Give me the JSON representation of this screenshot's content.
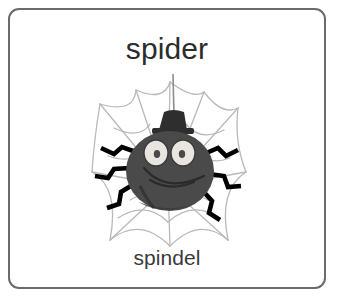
{
  "card": {
    "headword": "spider",
    "translation": "spindel",
    "border_color": "#6b6b6b",
    "background_color": "#ffffff",
    "text_color": "#2c2c2c"
  },
  "illustration": {
    "alt_label": "cartoon spider wearing a top hat hanging on a web",
    "subject": "spider",
    "accessory": "top-hat",
    "background": "spider-web",
    "colors": {
      "body": "#4a4a4a",
      "body_shadow": "#3a3a3a",
      "hat": "#2e2e2e",
      "legs": "#000000",
      "eye_white": "#e9e6e2",
      "eye_pupil": "#4a4a4a",
      "web": "#b9b9b9",
      "thread": "#8d8d8d"
    },
    "leg_count": 6,
    "eye_count": 2
  }
}
